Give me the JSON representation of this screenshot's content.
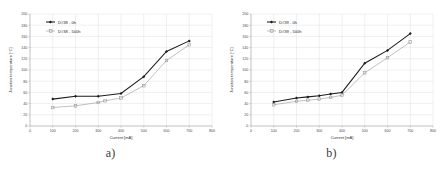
{
  "figure": {
    "panels": [
      {
        "caption": "a)",
        "legend": [
          {
            "label": "D#38 - 0h",
            "marker": "diamond",
            "color": "#1c1c1c"
          },
          {
            "label": "D#38 - 500h",
            "marker": "square",
            "color": "#9a9a9a"
          }
        ],
        "chart_data": {
          "type": "line",
          "title": "",
          "xlabel": "Current [mA]",
          "ylabel": "Junction temperature [°C]",
          "xlim": [
            0,
            800
          ],
          "ylim": [
            0,
            200
          ],
          "xticks": [
            0,
            100,
            200,
            300,
            400,
            500,
            600,
            700,
            800
          ],
          "yticks": [
            0,
            20,
            40,
            60,
            80,
            100,
            120,
            140,
            160,
            180,
            200
          ],
          "grid": true,
          "legend_position": "upper-left",
          "series": [
            {
              "name": "D#38 - 0h",
              "x": [
                100,
                200,
                300,
                400,
                500,
                600,
                700
              ],
              "values": [
                48,
                53,
                53,
                58,
                88,
                133,
                152
              ]
            },
            {
              "name": "D#38 - 500h",
              "x": [
                100,
                200,
                300,
                330,
                400,
                500,
                600,
                700
              ],
              "values": [
                33,
                36,
                42,
                45,
                50,
                72,
                117,
                145
              ]
            }
          ]
        }
      },
      {
        "caption": "b)",
        "legend": [
          {
            "label": "D#39 - 0h",
            "marker": "diamond",
            "color": "#1c1c1c"
          },
          {
            "label": "D#39 - 500h",
            "marker": "square",
            "color": "#9a9a9a"
          }
        ],
        "chart_data": {
          "type": "line",
          "title": "",
          "xlabel": "Current [mA]",
          "ylabel": "Junction temperature [°C]",
          "xlim": [
            0,
            800
          ],
          "ylim": [
            0,
            200
          ],
          "xticks": [
            0,
            100,
            200,
            300,
            400,
            500,
            600,
            700,
            800
          ],
          "yticks": [
            0,
            20,
            40,
            60,
            80,
            100,
            120,
            140,
            160,
            180,
            200
          ],
          "grid": true,
          "legend_position": "upper-left",
          "series": [
            {
              "name": "D#39 - 0h",
              "x": [
                100,
                200,
                250,
                300,
                350,
                400,
                500,
                600,
                700
              ],
              "values": [
                43,
                50,
                52,
                54,
                57,
                60,
                112,
                135,
                165
              ]
            },
            {
              "name": "D#39 - 500h",
              "x": [
                100,
                200,
                250,
                300,
                350,
                400,
                500,
                600,
                700
              ],
              "values": [
                38,
                44,
                46,
                48,
                51,
                55,
                95,
                122,
                150
              ]
            }
          ]
        }
      }
    ]
  }
}
